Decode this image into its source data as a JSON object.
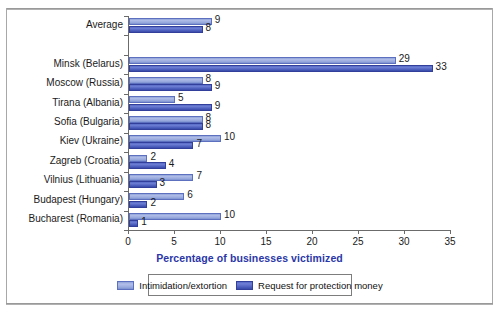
{
  "chart_data": {
    "type": "bar",
    "orientation": "horizontal",
    "title": "",
    "xlabel": "Percentage of businesses victimized",
    "ylabel": "",
    "xlim": [
      0,
      35
    ],
    "xticks": [
      0,
      5,
      10,
      15,
      20,
      25,
      30,
      35
    ],
    "grid": false,
    "legend_position": "bottom",
    "categories": [
      "Average",
      "Minsk (Belarus)",
      "Moscow (Russia)",
      "Tirana (Albania)",
      "Sofia (Bulgaria)",
      "Kiev (Ukraine)",
      "Zagreb (Croatia)",
      "Vilnius (Lithuania)",
      "Budapest (Hungary)",
      "Bucharest (Romania)"
    ],
    "series": [
      {
        "name": "Intimidation/extortion",
        "color": "#9badde",
        "values": [
          9,
          29,
          8,
          5,
          8,
          10,
          2,
          7,
          6,
          10
        ]
      },
      {
        "name": "Request for protection money",
        "color": "#4a5cbb",
        "values": [
          8,
          33,
          9,
          9,
          8,
          7,
          4,
          3,
          2,
          1
        ]
      }
    ]
  },
  "axis": {
    "x_tick_labels": [
      "0",
      "5",
      "10",
      "15",
      "20",
      "25",
      "30",
      "35"
    ],
    "x_title": "Percentage of businesses victimized",
    "x_title_color": "#2b37a8"
  },
  "legend": {
    "items": [
      {
        "label": "Intimidation/extortion",
        "swatch": "light"
      },
      {
        "label": "Request for protection money",
        "swatch": "dark"
      }
    ]
  }
}
